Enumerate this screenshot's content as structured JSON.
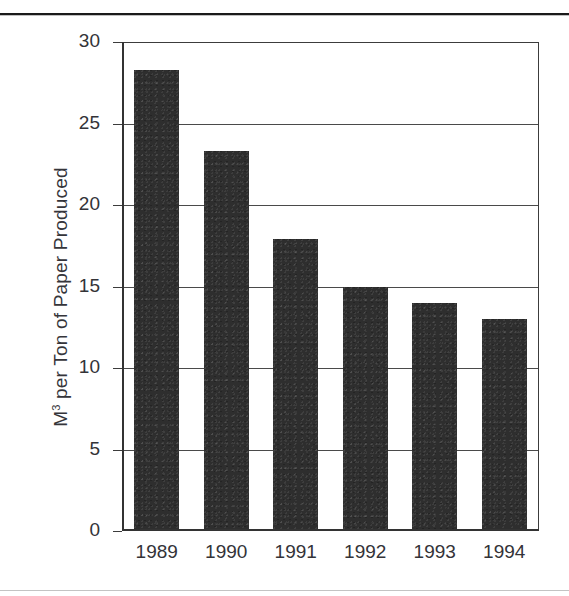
{
  "page": {
    "top_rule": "horizontal-rule",
    "bottom_rule": "horizontal-rule"
  },
  "chart_data": {
    "type": "bar",
    "title": "",
    "subtitle": "",
    "xlabel": "",
    "ylabel": "M3 per Ton of Paper Produced",
    "ylabel_base": "M",
    "ylabel_exponent": "3",
    "ylabel_rest": " per Ton of Paper Produced",
    "categories": [
      "1989",
      "1990",
      "1991",
      "1992",
      "1993",
      "1994"
    ],
    "values": [
      28.3,
      23.3,
      17.9,
      15.0,
      14.0,
      13.0
    ],
    "series": [
      {
        "name": "M3 per Ton of Paper Produced",
        "values": [
          28.3,
          23.3,
          17.9,
          15.0,
          14.0,
          13.0
        ]
      }
    ],
    "ylim": [
      0,
      30
    ],
    "ytick_values": [
      0,
      5,
      10,
      15,
      20,
      25,
      30
    ],
    "ytick_labels": [
      "0",
      "5",
      "10",
      "15",
      "20",
      "25",
      "30"
    ],
    "grid": true,
    "grid_axis": "y",
    "legend": false,
    "legend_position": "none",
    "bar_color": "#2e2e2e",
    "axis_color": "#333333",
    "grid_color": "#4a4a4a",
    "background_color": "#ffffff",
    "annotations": []
  }
}
